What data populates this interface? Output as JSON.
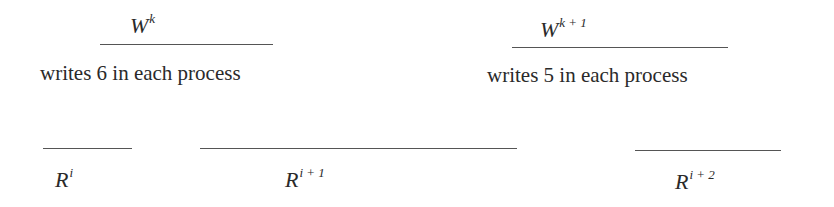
{
  "writes": [
    {
      "base": "W",
      "sup": "k",
      "caption": "writes 6 in each process"
    },
    {
      "base": "W",
      "sup": "k + 1",
      "caption": "writes 5 in each process"
    }
  ],
  "reads": [
    {
      "base": "R",
      "sup": "i"
    },
    {
      "base": "R",
      "sup": "i + 1"
    },
    {
      "base": "R",
      "sup": "i + 2"
    }
  ]
}
